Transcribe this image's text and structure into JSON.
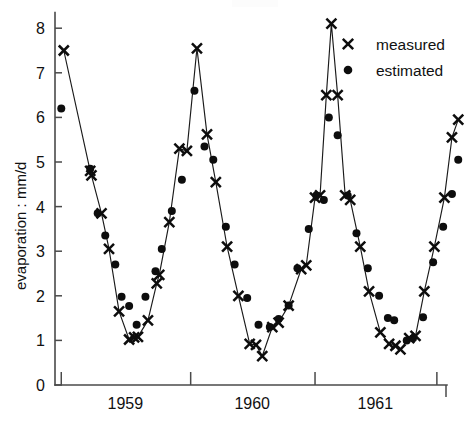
{
  "chart_data": {
    "type": "line",
    "title": "",
    "xlabel": "",
    "ylabel": "evaporation : mm/d",
    "ylim": [
      0,
      8.4
    ],
    "yticks": [
      0,
      1,
      2,
      3,
      4,
      5,
      6,
      7,
      8
    ],
    "ytick_labels": [
      "0",
      "1",
      "2",
      "3",
      "4",
      "5",
      "6",
      "7",
      "8"
    ],
    "xlim": [
      1958.72,
      1961.96
    ],
    "xticks": [
      1958.77,
      1959.8,
      1960.79,
      1961.76
    ],
    "xtick_labels": [
      "",
      "",
      "",
      ""
    ],
    "x_category_labels": [
      "1959",
      "1960",
      "1961"
    ],
    "x_category_positions": [
      1959.28,
      1960.29,
      1961.27
    ],
    "grid": false,
    "legend_position": "upper right",
    "legend": [
      "measured",
      "estimated"
    ],
    "series": [
      {
        "name": "measured",
        "marker": "x",
        "connected": true,
        "points": [
          [
            1958.79,
            7.5
          ],
          [
            1959.0,
            4.8
          ],
          [
            1959.01,
            4.7
          ],
          [
            1959.09,
            3.85
          ],
          [
            1959.15,
            3.05
          ],
          [
            1959.23,
            1.65
          ],
          [
            1959.31,
            1.02
          ],
          [
            1959.35,
            1.07
          ],
          [
            1959.38,
            1.08
          ],
          [
            1959.46,
            1.45
          ],
          [
            1959.53,
            2.28
          ],
          [
            1959.55,
            2.47
          ],
          [
            1959.63,
            3.65
          ],
          [
            1959.71,
            5.3
          ],
          [
            1959.77,
            5.25
          ],
          [
            1959.85,
            7.55
          ],
          [
            1959.93,
            5.62
          ],
          [
            1960.0,
            4.55
          ],
          [
            1960.09,
            3.1
          ],
          [
            1960.18,
            2.0
          ],
          [
            1960.27,
            0.92
          ],
          [
            1960.32,
            0.9
          ],
          [
            1960.37,
            0.65
          ],
          [
            1960.45,
            1.3
          ],
          [
            1960.5,
            1.4
          ],
          [
            1960.58,
            1.78
          ],
          [
            1960.68,
            2.6
          ],
          [
            1960.72,
            2.68
          ],
          [
            1960.79,
            4.2
          ],
          [
            1960.83,
            4.25
          ],
          [
            1960.88,
            6.5
          ],
          [
            1960.92,
            8.1
          ],
          [
            1960.97,
            6.5
          ],
          [
            1961.03,
            4.25
          ],
          [
            1961.07,
            4.15
          ],
          [
            1961.15,
            3.1
          ],
          [
            1961.22,
            2.1
          ],
          [
            1961.31,
            1.18
          ],
          [
            1961.38,
            0.92
          ],
          [
            1961.43,
            0.88
          ],
          [
            1961.47,
            0.8
          ],
          [
            1961.54,
            1.05
          ],
          [
            1961.59,
            1.1
          ],
          [
            1961.66,
            2.1
          ],
          [
            1961.74,
            3.1
          ],
          [
            1961.82,
            4.2
          ],
          [
            1961.88,
            5.55
          ],
          [
            1961.93,
            5.95
          ]
        ]
      },
      {
        "name": "estimated",
        "marker": "o",
        "connected": false,
        "points": [
          [
            1958.77,
            6.2
          ],
          [
            1959.0,
            4.85
          ],
          [
            1959.06,
            3.85
          ],
          [
            1959.12,
            3.35
          ],
          [
            1959.2,
            2.7
          ],
          [
            1959.25,
            1.98
          ],
          [
            1959.31,
            1.77
          ],
          [
            1959.37,
            1.35
          ],
          [
            1959.44,
            1.98
          ],
          [
            1959.52,
            2.55
          ],
          [
            1959.57,
            3.05
          ],
          [
            1959.65,
            3.9
          ],
          [
            1959.73,
            4.6
          ],
          [
            1959.83,
            6.6
          ],
          [
            1959.91,
            5.35
          ],
          [
            1959.98,
            5.05
          ],
          [
            1960.08,
            3.55
          ],
          [
            1960.15,
            2.7
          ],
          [
            1960.25,
            1.95
          ],
          [
            1960.34,
            1.35
          ],
          [
            1960.43,
            1.3
          ],
          [
            1960.5,
            1.48
          ],
          [
            1960.58,
            1.78
          ],
          [
            1960.65,
            2.62
          ],
          [
            1960.74,
            3.5
          ],
          [
            1960.8,
            4.25
          ],
          [
            1960.86,
            4.15
          ],
          [
            1960.9,
            6.0
          ],
          [
            1960.97,
            5.6
          ],
          [
            1961.05,
            4.25
          ],
          [
            1961.12,
            3.4
          ],
          [
            1961.21,
            2.62
          ],
          [
            1961.3,
            2.0
          ],
          [
            1961.37,
            1.5
          ],
          [
            1961.42,
            1.45
          ],
          [
            1961.52,
            1.0
          ],
          [
            1961.57,
            1.05
          ],
          [
            1961.65,
            1.52
          ],
          [
            1961.73,
            2.75
          ],
          [
            1961.81,
            3.55
          ],
          [
            1961.88,
            4.28
          ],
          [
            1961.93,
            5.05
          ]
        ]
      }
    ]
  }
}
